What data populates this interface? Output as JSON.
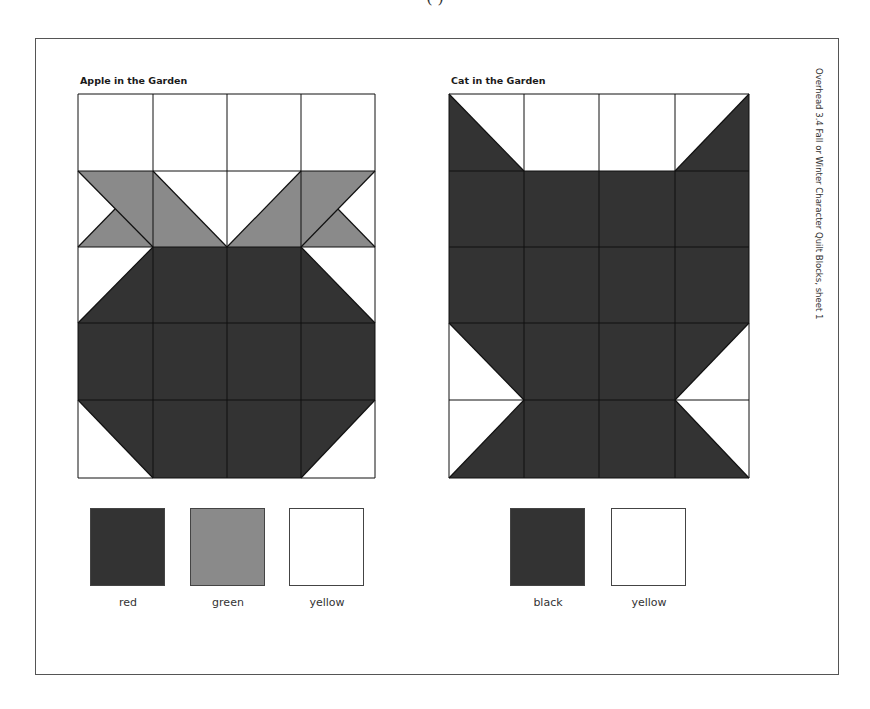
{
  "page": {
    "top_cut_text": "(          )",
    "side_caption": "Overhead 3.4 Fall or Winter Character Quilt Blocks, sheet 1"
  },
  "colors": {
    "dark": "#333333",
    "mid": "#8a8a8a",
    "light": "#ffffff",
    "grid_line": "#111111"
  },
  "blocks": [
    {
      "id": "apple",
      "title": "Apple in the Garden",
      "title_pos": [
        80,
        75
      ],
      "grid": {
        "x": [
          78,
          153,
          227,
          301,
          375
        ],
        "y": [
          94,
          171,
          247,
          323,
          400,
          478
        ]
      },
      "shapes": [
        {
          "fill": "mid",
          "points": "78,171 153,171 153,247 78,247 115,209"
        },
        {
          "fill": "mid",
          "points": "153,171 227,247 153,247"
        },
        {
          "fill": "mid",
          "points": "301,171 301,247 227,247"
        },
        {
          "fill": "mid",
          "points": "301,171 375,171 338,209 375,247 301,247"
        },
        {
          "fill": "dark",
          "points": "153,247 153,323 78,323"
        },
        {
          "fill": "dark",
          "points": "153,247 301,247 301,323 153,323"
        },
        {
          "fill": "dark",
          "points": "301,247 375,323 301,323"
        },
        {
          "fill": "dark",
          "points": "78,323 375,323 375,400 78,400"
        },
        {
          "fill": "dark",
          "points": "78,400 153,400 153,478"
        },
        {
          "fill": "dark",
          "points": "153,400 301,400 301,478 153,478"
        },
        {
          "fill": "dark",
          "points": "301,400 375,400 301,478"
        }
      ],
      "diagonals": [
        [
          78,
          171,
          153,
          247
        ],
        [
          153,
          171,
          227,
          247
        ],
        [
          301,
          171,
          227,
          247
        ],
        [
          375,
          171,
          301,
          247
        ],
        [
          115,
          209,
          78,
          247
        ],
        [
          338,
          209,
          375,
          247
        ],
        [
          153,
          247,
          78,
          323
        ],
        [
          301,
          247,
          375,
          323
        ],
        [
          78,
          400,
          153,
          478
        ],
        [
          375,
          400,
          301,
          478
        ]
      ],
      "swatches": [
        {
          "label": "red",
          "fill": "dark",
          "x": 90,
          "y": 508
        },
        {
          "label": "green",
          "fill": "mid",
          "x": 190,
          "y": 508
        },
        {
          "label": "yellow",
          "fill": "light",
          "x": 289,
          "y": 508
        }
      ]
    },
    {
      "id": "cat",
      "title": "Cat in the Garden",
      "title_pos": [
        451,
        75
      ],
      "grid": {
        "x": [
          449,
          524,
          599,
          675,
          749
        ],
        "y": [
          94,
          171,
          247,
          323,
          400,
          478
        ]
      },
      "shapes": [
        {
          "fill": "dark",
          "points": "449,94 524,171 449,171"
        },
        {
          "fill": "dark",
          "points": "749,94 749,171 675,171"
        },
        {
          "fill": "dark",
          "points": "449,171 749,171 749,323 449,323"
        },
        {
          "fill": "dark",
          "points": "449,323 524,323 524,400"
        },
        {
          "fill": "dark",
          "points": "524,323 675,323 675,478 524,478"
        },
        {
          "fill": "dark",
          "points": "675,323 749,323 675,400"
        },
        {
          "fill": "dark",
          "points": "524,400 524,478 449,478"
        },
        {
          "fill": "dark",
          "points": "675,400 749,478 675,478"
        }
      ],
      "diagonals": [
        [
          449,
          94,
          524,
          171
        ],
        [
          749,
          94,
          675,
          171
        ],
        [
          449,
          323,
          524,
          400
        ],
        [
          749,
          323,
          675,
          400
        ],
        [
          524,
          400,
          449,
          478
        ],
        [
          675,
          400,
          749,
          478
        ]
      ],
      "swatches": [
        {
          "label": "black",
          "fill": "dark",
          "x": 510,
          "y": 508
        },
        {
          "label": "yellow",
          "fill": "light",
          "x": 611,
          "y": 508
        }
      ]
    }
  ]
}
